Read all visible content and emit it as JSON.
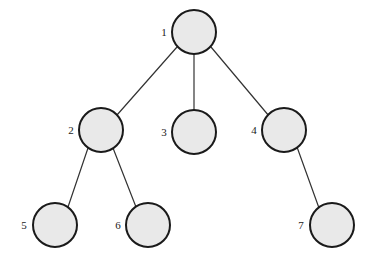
{
  "diagram": {
    "type": "tree-graph",
    "title": "",
    "canvas": {
      "width": 373,
      "height": 263,
      "background": "#ffffff"
    },
    "style": {
      "node_fill": "#e9e9e9",
      "node_stroke": "#1a1a1a",
      "node_stroke_width": 2,
      "node_radius": 22,
      "edge_color": "#333333",
      "edge_width": 1.2,
      "label_color": "#1a1a1a"
    },
    "nodes": [
      {
        "id": "1",
        "label": "1",
        "cx": 194,
        "cy": 32,
        "label_x": 164,
        "label_y": 33
      },
      {
        "id": "2",
        "label": "2",
        "cx": 101,
        "cy": 130,
        "label_x": 71,
        "label_y": 131
      },
      {
        "id": "3",
        "label": "3",
        "cx": 194,
        "cy": 132,
        "label_x": 164,
        "label_y": 133
      },
      {
        "id": "4",
        "label": "4",
        "cx": 284,
        "cy": 130,
        "label_x": 254,
        "label_y": 131
      },
      {
        "id": "5",
        "label": "5",
        "cx": 55,
        "cy": 225,
        "label_x": 24,
        "label_y": 226
      },
      {
        "id": "6",
        "label": "6",
        "cx": 148,
        "cy": 225,
        "label_x": 118,
        "label_y": 226
      },
      {
        "id": "7",
        "label": "7",
        "cx": 332,
        "cy": 225,
        "label_x": 301,
        "label_y": 226
      }
    ],
    "edges": [
      {
        "from": "1",
        "to": "2",
        "x1": 177,
        "y1": 47,
        "x2": 117,
        "y2": 115
      },
      {
        "from": "1",
        "to": "3",
        "x1": 194,
        "y1": 54,
        "x2": 194,
        "y2": 110
      },
      {
        "from": "1",
        "to": "4",
        "x1": 211,
        "y1": 47,
        "x2": 269,
        "y2": 116
      },
      {
        "from": "2",
        "to": "5",
        "x1": 88,
        "y1": 148,
        "x2": 68,
        "y2": 207
      },
      {
        "from": "2",
        "to": "6",
        "x1": 113,
        "y1": 148,
        "x2": 136,
        "y2": 207
      },
      {
        "from": "4",
        "to": "7",
        "x1": 297,
        "y1": 147,
        "x2": 319,
        "y2": 208
      }
    ]
  }
}
